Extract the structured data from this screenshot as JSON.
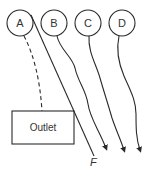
{
  "diagram": {
    "nodes": [
      {
        "id": "A",
        "label": "A"
      },
      {
        "id": "B",
        "label": "B"
      },
      {
        "id": "C",
        "label": "C"
      },
      {
        "id": "D",
        "label": "D"
      }
    ],
    "outlet": {
      "label": "Outlet"
    },
    "line_label": "F",
    "connections": [
      {
        "from": "A",
        "to": "Outlet",
        "style": "dashed"
      },
      {
        "from": "A",
        "to": "F",
        "style": "solid-straight"
      },
      {
        "from": "B",
        "to": "down",
        "style": "wavy-arrow"
      },
      {
        "from": "C",
        "to": "down",
        "style": "wavy-arrow"
      },
      {
        "from": "D",
        "to": "down",
        "style": "wavy-arrow"
      }
    ],
    "colors": {
      "stroke": "#2a2a2a",
      "text": "#333333",
      "background": "#ffffff"
    }
  }
}
